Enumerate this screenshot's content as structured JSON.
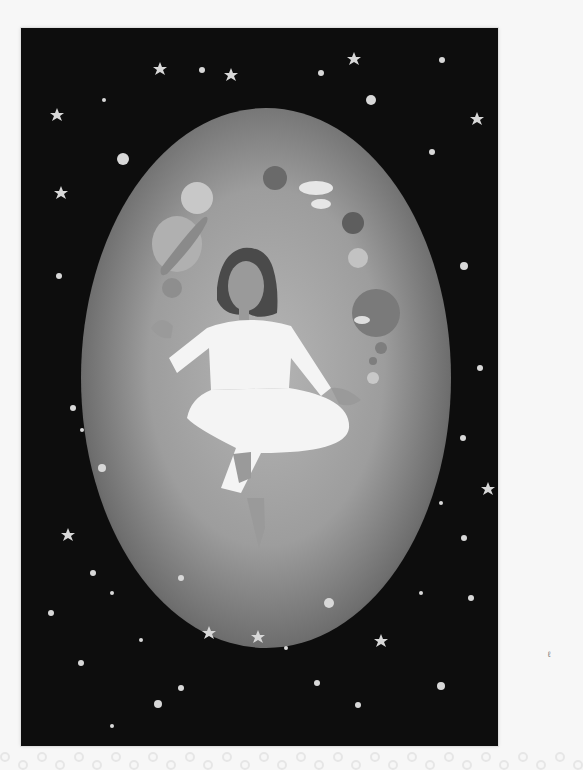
{
  "image": {
    "description": "Grayscale painted illustration of a woman with shoulder-length dark hair in a white outfit floating cross-legged inside a glowing oval, surrounded by planets, clouds, and stars against a dark starry background",
    "colors": {
      "background_page": "#f7f7f7",
      "space": "#0d0d0d",
      "glow_center": "#b5b5b5",
      "glow_edge": "#2c2c2c",
      "outfit": "#f4f4f4",
      "hair": "#4a4a4a",
      "skin": "#9a9a9a",
      "stars": "#d8d8d8"
    },
    "elements": {
      "planets": [
        "ringed-planet",
        "small-planet-left",
        "dark-planet-top",
        "dark-planet-right",
        "cloud-planet-right",
        "small-moons-right"
      ],
      "clouds": [
        "cloud-top-right"
      ],
      "star_clusters": [
        "sparkle-cluster-top",
        "sparkle-cluster-right",
        "sparkle-cluster-lower-right"
      ]
    },
    "edge_mark": "ℓ"
  }
}
